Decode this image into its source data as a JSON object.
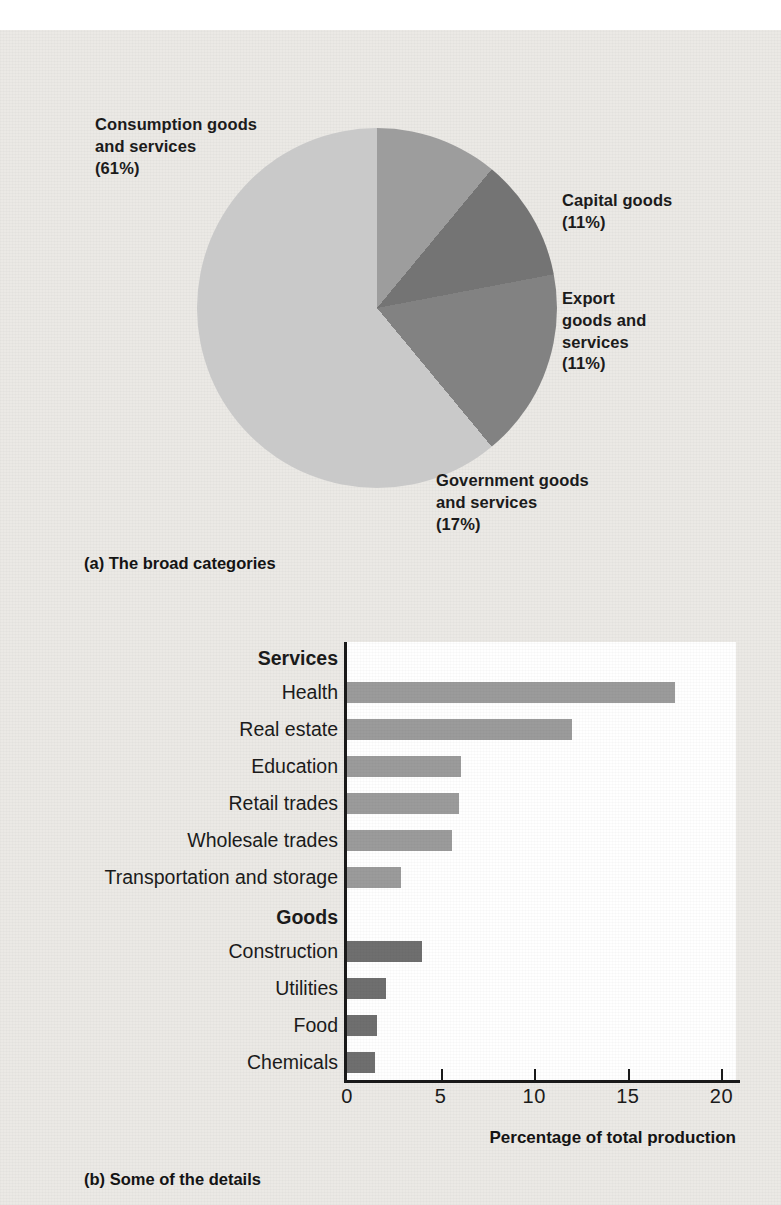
{
  "figure": {
    "panel_a": {
      "caption": "(a) The broad categories",
      "labels": {
        "consumption": "Consumption goods\nand services\n(61%)",
        "capital": "Capital goods\n(11%)",
        "export": "Export\ngoods and\nservices\n(11%)",
        "government": "Government goods\nand services\n(17%)"
      }
    },
    "panel_b": {
      "caption": "(b) Some of the details",
      "xaxis_title": "Percentage of total production"
    }
  },
  "chart_data": [
    {
      "type": "pie",
      "title": "(a) The broad categories",
      "labels": [
        "Consumption goods and services",
        "Capital goods",
        "Export goods and services",
        "Government goods and services"
      ],
      "values": [
        61,
        11,
        11,
        17
      ],
      "value_unit": "percent",
      "colors": [
        "#c9c9c9",
        "#9d9d9d",
        "#747474",
        "#828282"
      ],
      "start_angle_deg": 0,
      "direction": "clockwise",
      "legend": "labels placed outside slices with percentages in parentheses"
    },
    {
      "type": "bar",
      "orientation": "horizontal",
      "title": "(b) Some of the details",
      "xlabel": "Percentage of total production",
      "ylabel": "",
      "xlim": [
        0,
        20
      ],
      "xticks": [
        0,
        5,
        10,
        15,
        20
      ],
      "xtick_labels": [
        "0",
        "5",
        "10",
        "15",
        "20"
      ],
      "grid": false,
      "groups": [
        {
          "name": "Services",
          "color": "#9b9b9b",
          "categories": [
            "Health",
            "Real estate",
            "Education",
            "Retail trades",
            "Wholesale trades",
            "Transportation and storage"
          ],
          "values": [
            17.5,
            12.0,
            6.1,
            6.0,
            5.6,
            2.9
          ]
        },
        {
          "name": "Goods",
          "color": "#6f6f6f",
          "categories": [
            "Construction",
            "Utilities",
            "Food",
            "Chemicals"
          ],
          "values": [
            4.0,
            2.1,
            1.6,
            1.5
          ]
        }
      ]
    }
  ]
}
